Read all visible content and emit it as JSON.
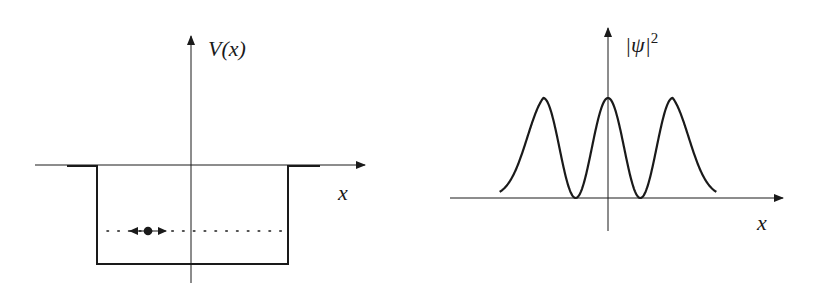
{
  "panels": [
    {
      "id": "potential-well",
      "y_axis_label": "V(x)",
      "x_axis_label": "x",
      "description": "Finite square potential well with a particle moving back and forth at a bound energy level",
      "energy_level_style": "dotted",
      "particle": {
        "shape": "dot",
        "motion": "left-right arrows"
      }
    },
    {
      "id": "probability-density",
      "y_axis_label": "|ψ|",
      "y_axis_label_exponent": "2",
      "x_axis_label": "x",
      "description": "Probability density with three equal peaks and two nodes, decaying tails outside the well"
    }
  ],
  "chart_data": {
    "type": "line",
    "title": "",
    "xlabel": "x",
    "ylabel": "|ψ|^2",
    "peaks": 3,
    "nodes": 2,
    "relative_peak_heights": [
      1,
      1,
      1
    ],
    "peak_positions_relative": [
      -1,
      0,
      1
    ],
    "node_positions_relative": [
      -0.5,
      0.5
    ],
    "tail_value_at_edges": 0.07,
    "x_range_relative": [
      -1.8,
      1.8
    ],
    "ylim": [
      0,
      1
    ]
  }
}
